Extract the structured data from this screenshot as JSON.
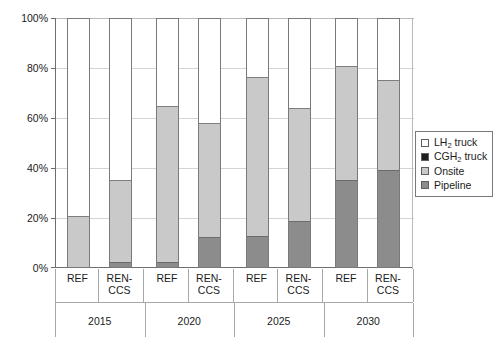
{
  "chart_data": {
    "type": "bar",
    "subtype": "stacked-100-percent",
    "title": "",
    "xlabel": "",
    "ylabel": "",
    "ylim": [
      0,
      100
    ],
    "ytick_labels": [
      "0%",
      "20%",
      "40%",
      "60%",
      "80%",
      "100%"
    ],
    "ytick_values": [
      0,
      20,
      40,
      60,
      80,
      100
    ],
    "grid": true,
    "legend_position": "right",
    "group_labels": [
      "2015",
      "2020",
      "2025",
      "2030"
    ],
    "scenario_labels": [
      "REF",
      "REN-CCS"
    ],
    "categories": [
      "2015 REF",
      "2015 REN-CCS",
      "2020 REF",
      "2020 REN-CCS",
      "2025 REF",
      "2025 REN-CCS",
      "2030 REF",
      "2030 REN-CCS"
    ],
    "series": [
      {
        "name": "Pipeline",
        "color": "#8c8c8c",
        "values": [
          0.0,
          2.0,
          2.0,
          12.0,
          12.5,
          18.5,
          35.0,
          39.0
        ]
      },
      {
        "name": "Onsite",
        "color": "#c9c9c9",
        "values": [
          20.5,
          33.0,
          62.5,
          45.5,
          63.5,
          45.0,
          45.5,
          36.0
        ]
      },
      {
        "name": "CGH2 truck",
        "color": "#1e1e1e",
        "values": [
          0.0,
          0.0,
          0.0,
          0.0,
          0.0,
          0.0,
          0.0,
          0.0
        ]
      },
      {
        "name": "LH2 truck",
        "color": "#ffffff",
        "values": [
          79.5,
          65.0,
          35.5,
          42.5,
          24.0,
          36.5,
          19.5,
          25.0
        ]
      }
    ],
    "cumulative_tops": {
      "pipeline": [
        0.0,
        2.0,
        2.0,
        12.0,
        12.5,
        18.5,
        35.0,
        39.0
      ],
      "onsite": [
        20.5,
        35.0,
        64.5,
        57.5,
        76.0,
        63.5,
        80.5,
        75.0
      ]
    }
  },
  "axis": {
    "y": {
      "ticks": [
        {
          "label": "100%",
          "value": 100
        },
        {
          "label": "80%",
          "value": 80
        },
        {
          "label": "60%",
          "value": 60
        },
        {
          "label": "40%",
          "value": 40
        },
        {
          "label": "20%",
          "value": 20
        },
        {
          "label": "0%",
          "value": 0
        }
      ]
    },
    "x": {
      "scenarios": [
        {
          "label": "REF"
        },
        {
          "label": "REN-CCS"
        },
        {
          "label": "REF"
        },
        {
          "label": "REN-CCS"
        },
        {
          "label": "REF"
        },
        {
          "label": "REN-CCS"
        },
        {
          "label": "REF"
        },
        {
          "label": "REN-CCS"
        }
      ],
      "years": [
        {
          "label": "2015"
        },
        {
          "label": "2020"
        },
        {
          "label": "2025"
        },
        {
          "label": "2030"
        }
      ]
    }
  },
  "legend": {
    "items": [
      {
        "label": "LH2 truck",
        "html": "LH<sub>2</sub> truck",
        "swatch": "white-swatch",
        "color": "#ffffff"
      },
      {
        "label": "CGH2 truck",
        "html": "CGH<sub>2</sub> truck",
        "swatch": "black-swatch",
        "color": "#1e1e1e"
      },
      {
        "label": "Onsite",
        "html": "Onsite",
        "swatch": "lightgray-swatch",
        "color": "#c9c9c9"
      },
      {
        "label": "Pipeline",
        "html": "Pipeline",
        "swatch": "darkgray-swatch",
        "color": "#8c8c8c"
      }
    ]
  }
}
